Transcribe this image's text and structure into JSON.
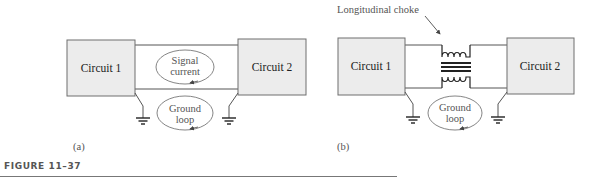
{
  "figure": {
    "caption": "FIGURE 11–37",
    "panels": [
      {
        "id": "a",
        "label": "(a)",
        "circuit1": "Circuit 1",
        "circuit2": "Circuit 2",
        "signal_loop": [
          "Signal",
          "current"
        ],
        "ground_loop": [
          "Ground",
          "loop"
        ]
      },
      {
        "id": "b",
        "label": "(b)",
        "circuit1": "Circuit 1",
        "circuit2": "Circuit 2",
        "choke_label": "Longitudinal choke",
        "ground_loop": [
          "Ground",
          "loop"
        ]
      }
    ]
  }
}
